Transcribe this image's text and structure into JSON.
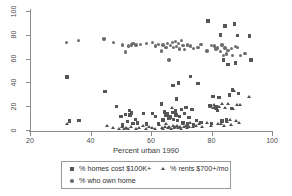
{
  "chart_data": {
    "type": "scatter",
    "title": "",
    "xlabel": "Percent urban 1990",
    "ylabel": "",
    "xlim": [
      20,
      100
    ],
    "ylim": [
      0,
      100
    ],
    "xticks": [
      20,
      40,
      60,
      80,
      100
    ],
    "yticks": [
      0,
      20,
      40,
      60,
      80,
      100
    ],
    "grid": false,
    "legend_position": "bottom",
    "series": [
      {
        "name": "% homes cost $100K+",
        "marker": "square",
        "color": "#565656",
        "points": [
          [
            32.2,
            44.5
          ],
          [
            33.0,
            7.5
          ],
          [
            36.2,
            7.8
          ],
          [
            44.8,
            32.3
          ],
          [
            48.5,
            20.0
          ],
          [
            50.0,
            11.5
          ],
          [
            50.5,
            4.2
          ],
          [
            51.5,
            13.0
          ],
          [
            52.2,
            7.0
          ],
          [
            52.8,
            16.5
          ],
          [
            53.0,
            12.5
          ],
          [
            53.5,
            14.2
          ],
          [
            54.0,
            5.5
          ],
          [
            54.8,
            9.0
          ],
          [
            55.5,
            6.0
          ],
          [
            57.5,
            14.0
          ],
          [
            58.5,
            5.0
          ],
          [
            60.5,
            13.8
          ],
          [
            61.5,
            11.5
          ],
          [
            62.5,
            5.5
          ],
          [
            63.5,
            22.0
          ],
          [
            64.0,
            8.5
          ],
          [
            64.5,
            15.0
          ],
          [
            65.0,
            12.0
          ],
          [
            65.5,
            13.5
          ],
          [
            66.0,
            10.0
          ],
          [
            66.5,
            11.0
          ],
          [
            67.0,
            14.8
          ],
          [
            67.2,
            37.5
          ],
          [
            67.5,
            9.0
          ],
          [
            68.0,
            16.0
          ],
          [
            68.2,
            12.5
          ],
          [
            68.5,
            26.0
          ],
          [
            68.8,
            8.0
          ],
          [
            69.0,
            39.5
          ],
          [
            69.5,
            11.5
          ],
          [
            70.0,
            17.5
          ],
          [
            70.5,
            6.5
          ],
          [
            71.0,
            14.0
          ],
          [
            71.5,
            19.0
          ],
          [
            72.0,
            5.0
          ],
          [
            72.5,
            10.5
          ],
          [
            73.0,
            45.0
          ],
          [
            73.5,
            17.5
          ],
          [
            74.0,
            4.5
          ],
          [
            75.0,
            8.0
          ],
          [
            75.5,
            39.0
          ],
          [
            76.5,
            6.5
          ],
          [
            78.8,
            91.5
          ],
          [
            79.5,
            20.5
          ],
          [
            80.0,
            5.5
          ],
          [
            80.5,
            28.0
          ],
          [
            81.5,
            19.5
          ],
          [
            82.0,
            16.5
          ],
          [
            82.5,
            27.5
          ],
          [
            83.0,
            80.0
          ],
          [
            83.5,
            7.5
          ],
          [
            84.0,
            59.0
          ],
          [
            84.5,
            87.5
          ],
          [
            85.0,
            8.5
          ],
          [
            85.5,
            55.0
          ],
          [
            86.0,
            29.5
          ],
          [
            86.5,
            18.0
          ],
          [
            87.0,
            33.5
          ],
          [
            87.5,
            89.0
          ],
          [
            88.0,
            56.5
          ],
          [
            88.5,
            79.5
          ],
          [
            89.0,
            30.5
          ],
          [
            92.5,
            79.0
          ],
          [
            93.0,
            59.0
          ]
        ]
      },
      {
        "name": "% who own home",
        "marker": "circle",
        "color": "#6e6e6e",
        "points": [
          [
            32.0,
            73.5
          ],
          [
            36.0,
            75.5
          ],
          [
            44.5,
            76.5
          ],
          [
            47.5,
            73.5
          ],
          [
            50.5,
            71.5
          ],
          [
            51.5,
            65.5
          ],
          [
            52.5,
            70.5
          ],
          [
            53.5,
            71.5
          ],
          [
            54.0,
            72.5
          ],
          [
            55.0,
            71.5
          ],
          [
            56.5,
            72.0
          ],
          [
            58.5,
            72.5
          ],
          [
            60.5,
            73.5
          ],
          [
            61.5,
            70.5
          ],
          [
            62.5,
            72.0
          ],
          [
            63.5,
            66.5
          ],
          [
            64.0,
            71.5
          ],
          [
            65.0,
            69.5
          ],
          [
            65.5,
            72.5
          ],
          [
            66.0,
            59.0
          ],
          [
            66.5,
            71.0
          ],
          [
            67.0,
            73.5
          ],
          [
            67.5,
            69.5
          ],
          [
            68.0,
            74.5
          ],
          [
            68.5,
            70.0
          ],
          [
            69.0,
            72.5
          ],
          [
            69.5,
            68.0
          ],
          [
            70.0,
            75.5
          ],
          [
            70.5,
            71.0
          ],
          [
            71.0,
            67.5
          ],
          [
            72.0,
            71.5
          ],
          [
            73.0,
            70.5
          ],
          [
            74.0,
            68.5
          ],
          [
            75.5,
            69.5
          ],
          [
            76.5,
            72.0
          ],
          [
            78.5,
            66.5
          ],
          [
            80.0,
            71.0
          ],
          [
            81.0,
            70.5
          ],
          [
            81.5,
            68.0
          ],
          [
            82.0,
            69.0
          ],
          [
            83.0,
            66.0
          ],
          [
            83.5,
            71.5
          ],
          [
            84.0,
            62.5
          ],
          [
            84.5,
            69.0
          ],
          [
            85.0,
            64.0
          ],
          [
            85.5,
            67.0
          ],
          [
            86.5,
            68.5
          ],
          [
            87.0,
            62.5
          ],
          [
            88.0,
            70.0
          ],
          [
            88.5,
            69.5
          ],
          [
            89.5,
            62.5
          ],
          [
            91.0,
            64.5
          ]
        ]
      },
      {
        "name": "% rents $700+/mo",
        "marker": "triangle",
        "color": "#4f4f4f",
        "points": [
          [
            32.2,
            4.5
          ],
          [
            45.5,
            3.5
          ],
          [
            47.5,
            1.5
          ],
          [
            49.5,
            0.8
          ],
          [
            50.5,
            2.0
          ],
          [
            51.0,
            1.0
          ],
          [
            51.8,
            1.5
          ],
          [
            52.5,
            0.8
          ],
          [
            53.5,
            2.5
          ],
          [
            55.0,
            1.0
          ],
          [
            56.0,
            1.5
          ],
          [
            57.5,
            3.5
          ],
          [
            58.5,
            1.0
          ],
          [
            59.5,
            2.0
          ],
          [
            60.5,
            1.5
          ],
          [
            61.5,
            0.8
          ],
          [
            62.5,
            4.0
          ],
          [
            63.5,
            1.5
          ],
          [
            64.0,
            1.0
          ],
          [
            64.5,
            2.0
          ],
          [
            65.0,
            4.5
          ],
          [
            65.5,
            1.5
          ],
          [
            66.0,
            2.5
          ],
          [
            66.5,
            1.0
          ],
          [
            67.0,
            18.5
          ],
          [
            67.2,
            3.0
          ],
          [
            67.5,
            1.5
          ],
          [
            68.0,
            2.0
          ],
          [
            68.5,
            3.5
          ],
          [
            69.0,
            1.5
          ],
          [
            69.5,
            2.5
          ],
          [
            70.0,
            1.0
          ],
          [
            70.5,
            5.0
          ],
          [
            71.0,
            2.0
          ],
          [
            71.5,
            3.0
          ],
          [
            72.0,
            1.5
          ],
          [
            72.5,
            2.5
          ],
          [
            73.0,
            6.0
          ],
          [
            74.0,
            2.0
          ],
          [
            75.0,
            3.5
          ],
          [
            76.0,
            5.0
          ],
          [
            77.0,
            2.5
          ],
          [
            78.5,
            6.0
          ],
          [
            79.5,
            19.0
          ],
          [
            80.0,
            3.5
          ],
          [
            80.5,
            18.5
          ],
          [
            81.0,
            20.5
          ],
          [
            81.5,
            17.5
          ],
          [
            82.0,
            4.5
          ],
          [
            82.5,
            19.5
          ],
          [
            83.0,
            5.0
          ],
          [
            83.5,
            21.5
          ],
          [
            84.0,
            3.5
          ],
          [
            84.5,
            18.5
          ],
          [
            85.0,
            6.5
          ],
          [
            85.5,
            22.0
          ],
          [
            86.0,
            8.5
          ],
          [
            86.5,
            4.0
          ],
          [
            87.0,
            17.5
          ],
          [
            87.5,
            33.0
          ],
          [
            88.0,
            7.5
          ],
          [
            88.5,
            21.0
          ],
          [
            89.0,
            5.5
          ],
          [
            89.5,
            20.5
          ],
          [
            92.5,
            28.0
          ]
        ]
      }
    ]
  },
  "legend": {
    "entries": [
      {
        "label": "% homes cost $100K+",
        "marker": "square-marker"
      },
      {
        "label": "% rents $700+/mo",
        "marker": "triangle-marker"
      },
      {
        "label": "% who own home",
        "marker": "circle-marker"
      }
    ]
  }
}
